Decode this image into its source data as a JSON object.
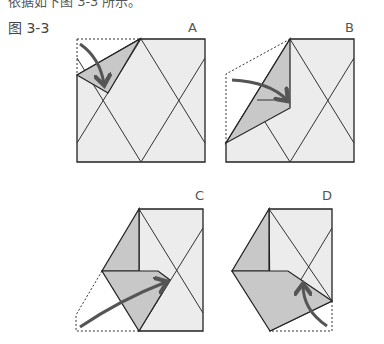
{
  "header": {
    "cropped_text": "依据如下图 3-3 所示。",
    "figure_label": "图 3-3"
  },
  "panels": [
    {
      "id": "A",
      "label": "A"
    },
    {
      "id": "B",
      "label": "B"
    },
    {
      "id": "C",
      "label": "C"
    },
    {
      "id": "D",
      "label": "D"
    }
  ],
  "colors": {
    "paper": "#ececec",
    "fold_shade": "#c8c8c8",
    "line": "#222222",
    "arrow": "#555555",
    "dashed": "#333333"
  }
}
